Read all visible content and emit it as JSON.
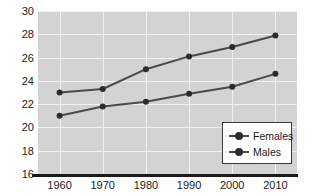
{
  "chart_data": {
    "type": "line",
    "title": "",
    "xlabel": "",
    "ylabel": "",
    "categories": [
      "1960",
      "1970",
      "1980",
      "1990",
      "2000",
      "2010"
    ],
    "x": [
      1960,
      1970,
      1980,
      1990,
      2000,
      2010
    ],
    "series": [
      {
        "name": "Females",
        "values": [
          23.0,
          23.3,
          25.0,
          26.1,
          26.9,
          27.9
        ]
      },
      {
        "name": "Males",
        "values": [
          21.0,
          21.8,
          22.2,
          22.9,
          23.5,
          24.6
        ]
      }
    ],
    "ylim": [
      16,
      30
    ],
    "yticks": [
      "16",
      "18",
      "20",
      "22",
      "24",
      "26",
      "28",
      "30"
    ],
    "ytick_values": [
      16,
      18,
      20,
      22,
      24,
      26,
      28,
      30
    ],
    "xticks": [
      "1960",
      "1970",
      "1980",
      "1990",
      "2000",
      "2010"
    ],
    "grid": true,
    "legend_position": "bottom-right",
    "legend_entries": [
      "Females",
      "Males"
    ],
    "colors": {
      "plot_background": "#d3d3d3",
      "gridline": "#f2f2f2",
      "line": "#4a4a4a",
      "marker": "#2b2b2b",
      "axis": "#1a1a1a",
      "legend_background": "#ffffff",
      "legend_border": "#3a3a3a",
      "text": "#1a1a1a"
    }
  }
}
